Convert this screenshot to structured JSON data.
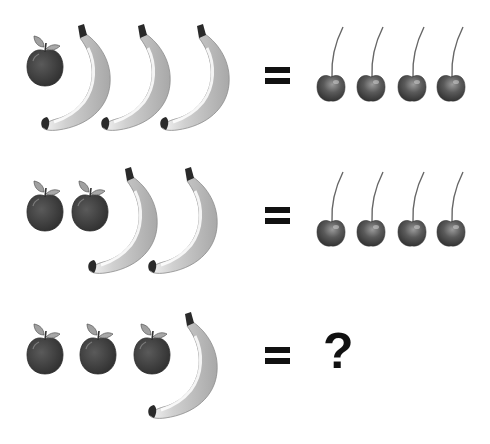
{
  "puzzle": {
    "rows": [
      {
        "left": {
          "apples": 1,
          "bananas": 3
        },
        "operator": "=",
        "right": {
          "cherries": 4
        }
      },
      {
        "left": {
          "apples": 2,
          "bananas": 2
        },
        "operator": "=",
        "right": {
          "cherries": 4
        }
      },
      {
        "left": {
          "apples": 3,
          "bananas": 1
        },
        "operator": "=",
        "right": {
          "unknown": "?"
        }
      }
    ],
    "icons": [
      "apple-icon",
      "banana-icon",
      "cherry-icon",
      "equals-sign",
      "question-mark"
    ],
    "colors": {
      "apple": "#3f3f3f",
      "leaf": "#9a9a9a",
      "banana": "#b5b5b5",
      "banana_highlight": "#f2f2f2",
      "banana_tip": "#2a2a2a",
      "cherry": "#555555",
      "stem": "#666666",
      "symbol": "#111111"
    }
  }
}
